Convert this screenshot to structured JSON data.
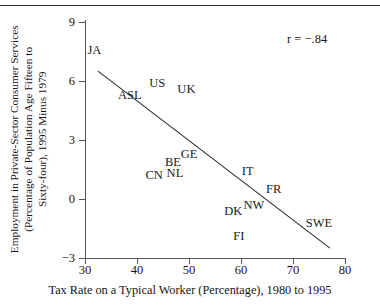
{
  "chart_data": {
    "type": "scatter",
    "title": "",
    "xlabel": "Tax Rate on a Typical Worker (Percentage), 1980 to 1995",
    "ylabel": "Employment in Private-Sector Consumer Services (Percentage of Population Age Fifteen to Sixty-four), 1995 Minus 1979",
    "ylabel_lines": [
      "Employment in Private-Sector Consumer Services",
      "(Percentage of Population Age Fifteen to",
      "Sixty-four), 1995 Minus 1979"
    ],
    "xlim": [
      30,
      80
    ],
    "ylim": [
      -3,
      9
    ],
    "xticks": [
      30,
      40,
      50,
      60,
      70,
      80
    ],
    "yticks": [
      9,
      6,
      3,
      0,
      -3
    ],
    "grid": false,
    "legend": false,
    "annotation": "r = −.84",
    "marker_style": "text-label-only",
    "points": [
      {
        "label": "JA",
        "x": 31.8,
        "y": 7.6
      },
      {
        "label": "ASL",
        "x": 38.6,
        "y": 5.3
      },
      {
        "label": "US",
        "x": 43.9,
        "y": 5.9
      },
      {
        "label": "UK",
        "x": 49.5,
        "y": 5.6
      },
      {
        "label": "GE",
        "x": 50.0,
        "y": 2.3
      },
      {
        "label": "BE",
        "x": 46.9,
        "y": 1.9
      },
      {
        "label": "NL",
        "x": 47.3,
        "y": 1.3
      },
      {
        "label": "CN",
        "x": 43.3,
        "y": 1.2
      },
      {
        "label": "IT",
        "x": 61.3,
        "y": 1.4
      },
      {
        "label": "FR",
        "x": 66.3,
        "y": 0.5
      },
      {
        "label": "NW",
        "x": 62.5,
        "y": -0.3
      },
      {
        "label": "DK",
        "x": 58.5,
        "y": -0.6
      },
      {
        "label": "SWE",
        "x": 75.0,
        "y": -1.2
      },
      {
        "label": "FI",
        "x": 59.6,
        "y": -1.9
      }
    ],
    "trend_line": {
      "type": "linear-fit",
      "x_start": 32.5,
      "y_start": 6.5,
      "x_end": 77.1,
      "y_end": -2.5
    }
  }
}
